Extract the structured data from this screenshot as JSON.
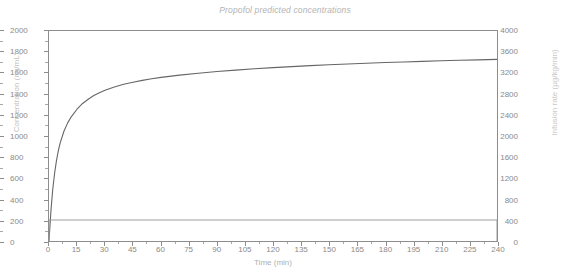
{
  "chart_data": {
    "type": "line",
    "title": "Propofol predicted concentrations",
    "xlabel": "Time (min)",
    "ylabel": "Concentration (ng/mL)",
    "ylabel_right": "Infusion rate (µg/kg/min)",
    "xlim": [
      0,
      240
    ],
    "ylim": [
      0,
      4000
    ],
    "ylim_right": [
      0,
      2000
    ],
    "xticks": [
      0,
      15,
      30,
      45,
      60,
      75,
      90,
      105,
      120,
      135,
      150,
      165,
      180,
      195,
      210,
      225,
      240
    ],
    "yticks": [
      0,
      400,
      800,
      1200,
      1600,
      2000,
      2400,
      2800,
      3200,
      3600,
      4000
    ],
    "yticks_right": [
      0,
      200,
      400,
      600,
      800,
      1000,
      1200,
      1400,
      1600,
      1800,
      2000
    ],
    "grid": false,
    "legend": "none",
    "series": [
      {
        "name": "Predicted concentration",
        "axis": "left",
        "color": "#666666",
        "x": [
          0,
          1,
          2,
          3,
          4,
          5,
          6,
          8,
          10,
          12,
          15,
          18,
          21,
          24,
          27,
          30,
          35,
          40,
          45,
          50,
          55,
          60,
          70,
          80,
          90,
          100,
          110,
          120,
          130,
          140,
          150,
          160,
          170,
          180,
          190,
          200,
          210,
          220,
          230,
          240
        ],
        "y": [
          0,
          560,
          980,
          1290,
          1530,
          1720,
          1870,
          2090,
          2250,
          2370,
          2510,
          2620,
          2700,
          2770,
          2825,
          2872,
          2935,
          2985,
          3025,
          3060,
          3090,
          3116,
          3160,
          3196,
          3228,
          3255,
          3280,
          3302,
          3322,
          3340,
          3357,
          3372,
          3386,
          3399,
          3411,
          3422,
          3432,
          3442,
          3451,
          3459
        ]
      },
      {
        "name": "Infusion rate",
        "axis": "right",
        "color": "#9d9d9d",
        "x": [
          0,
          0,
          240,
          240
        ],
        "y": [
          0,
          200,
          200,
          0
        ]
      }
    ]
  }
}
